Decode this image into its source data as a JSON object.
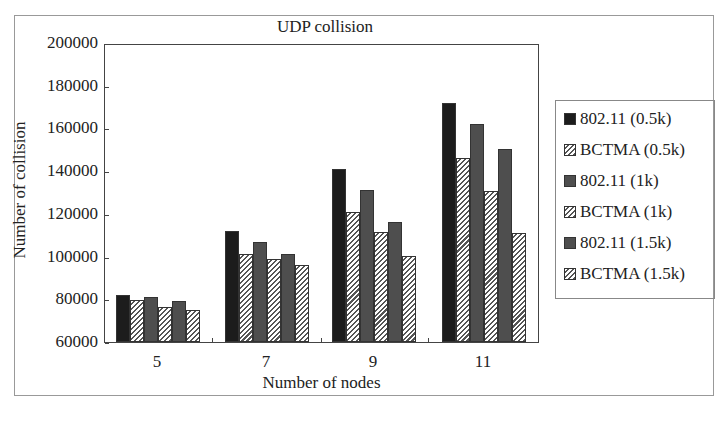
{
  "chart_data": {
    "type": "bar",
    "title": "UDP collision",
    "xlabel": "Number of nodes",
    "ylabel": "Number of collision",
    "categories": [
      "5",
      "7",
      "9",
      "11"
    ],
    "ylim": [
      60000,
      200000
    ],
    "yticks": [
      "200000",
      "180000",
      "160000",
      "140000",
      "120000",
      "100000",
      "80000",
      "60000"
    ],
    "grid": false,
    "legend_position": "right",
    "series": [
      {
        "name": "802.11 (0.5k)",
        "values": [
          82000,
          112000,
          141000,
          172000
        ]
      },
      {
        "name": "BCTMA (0.5k)",
        "values": [
          79500,
          101000,
          121000,
          146000
        ]
      },
      {
        "name": "802.11 (1k)",
        "values": [
          81000,
          107000,
          131000,
          162000
        ]
      },
      {
        "name": "BCTMA (1k)",
        "values": [
          76500,
          99000,
          111500,
          130500
        ]
      },
      {
        "name": "802.11 (1.5k)",
        "values": [
          79000,
          101000,
          116000,
          150500
        ]
      },
      {
        "name": "BCTMA (1.5k)",
        "values": [
          75000,
          96000,
          100500,
          111000
        ]
      }
    ]
  }
}
